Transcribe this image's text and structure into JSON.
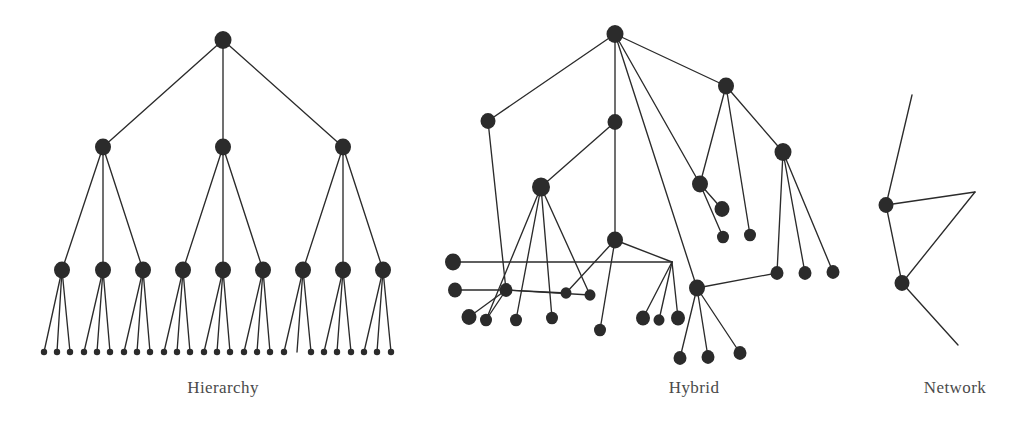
{
  "figure": {
    "width": 1031,
    "height": 423,
    "background_color": "#ffffff",
    "ink_color": "#2b2b2b",
    "caption_color": "#4a4a4a",
    "panel_count": 3
  },
  "panels": [
    {
      "id": "hierarchy",
      "caption": "Hierarchy",
      "caption_x": 223,
      "caption_y": 378,
      "description": "Strict 3-level tree: 1 root, 3 second-level nodes, 9 third-level nodes, 27 leaf nodes"
    },
    {
      "id": "hybrid",
      "caption": "Hybrid",
      "caption_x": 694,
      "caption_y": 378,
      "description": "Irregular tree-and-graph mixture with crossing edges and shared children"
    },
    {
      "id": "network",
      "caption": "Network",
      "caption_x": 955,
      "caption_y": 378,
      "description": "Two nodes with open-ended edges radiating outward"
    }
  ],
  "chart_data": {
    "type": "diagram",
    "title": "",
    "subtitle": "",
    "legend": [],
    "graphs": [
      {
        "name": "Hierarchy",
        "label": "Hierarchy",
        "node_radius_by_level": [
          8.5,
          8.0,
          8.0,
          3.2
        ],
        "nodes": [
          {
            "id": "h-root",
            "x": 223,
            "y": 40,
            "r": 8.5,
            "level": 0
          },
          {
            "id": "h-a",
            "x": 103,
            "y": 147,
            "r": 8.0,
            "level": 1
          },
          {
            "id": "h-b",
            "x": 223,
            "y": 147,
            "r": 8.0,
            "level": 1
          },
          {
            "id": "h-c",
            "x": 343,
            "y": 147,
            "r": 8.0,
            "level": 1
          },
          {
            "id": "h-a1",
            "x": 62,
            "y": 270,
            "r": 8.0,
            "level": 2
          },
          {
            "id": "h-a2",
            "x": 103,
            "y": 270,
            "r": 8.0,
            "level": 2
          },
          {
            "id": "h-a3",
            "x": 143,
            "y": 270,
            "r": 8.0,
            "level": 2
          },
          {
            "id": "h-b1",
            "x": 183,
            "y": 270,
            "r": 8.0,
            "level": 2
          },
          {
            "id": "h-b2",
            "x": 223,
            "y": 270,
            "r": 8.0,
            "level": 2
          },
          {
            "id": "h-b3",
            "x": 263,
            "y": 270,
            "r": 8.0,
            "level": 2
          },
          {
            "id": "h-c1",
            "x": 303,
            "y": 270,
            "r": 8.0,
            "level": 2
          },
          {
            "id": "h-c2",
            "x": 343,
            "y": 270,
            "r": 8.0,
            "level": 2
          },
          {
            "id": "h-c3",
            "x": 383,
            "y": 270,
            "r": 8.0,
            "level": 2
          },
          {
            "id": "h-l1",
            "x": 44,
            "y": 352,
            "r": 3.2,
            "level": 3
          },
          {
            "id": "h-l2",
            "x": 57,
            "y": 352,
            "r": 3.2,
            "level": 3
          },
          {
            "id": "h-l3",
            "x": 70,
            "y": 352,
            "r": 3.2,
            "level": 3
          },
          {
            "id": "h-l4",
            "x": 84,
            "y": 352,
            "r": 3.2,
            "level": 3
          },
          {
            "id": "h-l5",
            "x": 97,
            "y": 352,
            "r": 3.2,
            "level": 3
          },
          {
            "id": "h-l6",
            "x": 110,
            "y": 352,
            "r": 3.2,
            "level": 3
          },
          {
            "id": "h-l7",
            "x": 124,
            "y": 352,
            "r": 3.2,
            "level": 3
          },
          {
            "id": "h-l8",
            "x": 137,
            "y": 352,
            "r": 3.2,
            "level": 3
          },
          {
            "id": "h-l9",
            "x": 150,
            "y": 352,
            "r": 3.2,
            "level": 3
          },
          {
            "id": "h-l10",
            "x": 164,
            "y": 352,
            "r": 3.2,
            "level": 3
          },
          {
            "id": "h-l11",
            "x": 177,
            "y": 352,
            "r": 3.2,
            "level": 3
          },
          {
            "id": "h-l12",
            "x": 190,
            "y": 352,
            "r": 3.2,
            "level": 3
          },
          {
            "id": "h-l13",
            "x": 204,
            "y": 352,
            "r": 3.2,
            "level": 3
          },
          {
            "id": "h-l14",
            "x": 217,
            "y": 352,
            "r": 3.2,
            "level": 3
          },
          {
            "id": "h-l15",
            "x": 230,
            "y": 352,
            "r": 3.2,
            "level": 3
          },
          {
            "id": "h-l16",
            "x": 244,
            "y": 352,
            "r": 3.2,
            "level": 3
          },
          {
            "id": "h-l17",
            "x": 257,
            "y": 352,
            "r": 3.2,
            "level": 3
          },
          {
            "id": "h-l18",
            "x": 270,
            "y": 352,
            "r": 3.2,
            "level": 3
          },
          {
            "id": "h-l19",
            "x": 284,
            "y": 352,
            "r": 3.2,
            "level": 3
          },
          {
            "id": "h-l20",
            "x": 297,
            "y": 352,
            "r": 0.0,
            "level": 3
          },
          {
            "id": "h-l21",
            "x": 311,
            "y": 352,
            "r": 3.2,
            "level": 3
          },
          {
            "id": "h-l22",
            "x": 324,
            "y": 352,
            "r": 3.2,
            "level": 3
          },
          {
            "id": "h-l23",
            "x": 337,
            "y": 352,
            "r": 3.2,
            "level": 3
          },
          {
            "id": "h-l24",
            "x": 351,
            "y": 352,
            "r": 3.2,
            "level": 3
          },
          {
            "id": "h-l25",
            "x": 364,
            "y": 352,
            "r": 3.2,
            "level": 3
          },
          {
            "id": "h-l26",
            "x": 377,
            "y": 352,
            "r": 3.2,
            "level": 3
          },
          {
            "id": "h-l27",
            "x": 391,
            "y": 352,
            "r": 3.2,
            "level": 3
          }
        ],
        "edges": [
          [
            "h-root",
            "h-a"
          ],
          [
            "h-root",
            "h-b"
          ],
          [
            "h-root",
            "h-c"
          ],
          [
            "h-a",
            "h-a1"
          ],
          [
            "h-a",
            "h-a2"
          ],
          [
            "h-a",
            "h-a3"
          ],
          [
            "h-b",
            "h-b1"
          ],
          [
            "h-b",
            "h-b2"
          ],
          [
            "h-b",
            "h-b3"
          ],
          [
            "h-c",
            "h-c1"
          ],
          [
            "h-c",
            "h-c2"
          ],
          [
            "h-c",
            "h-c3"
          ],
          [
            "h-a1",
            "h-l1"
          ],
          [
            "h-a1",
            "h-l2"
          ],
          [
            "h-a1",
            "h-l3"
          ],
          [
            "h-a2",
            "h-l4"
          ],
          [
            "h-a2",
            "h-l5"
          ],
          [
            "h-a2",
            "h-l6"
          ],
          [
            "h-a3",
            "h-l7"
          ],
          [
            "h-a3",
            "h-l8"
          ],
          [
            "h-a3",
            "h-l9"
          ],
          [
            "h-b1",
            "h-l10"
          ],
          [
            "h-b1",
            "h-l11"
          ],
          [
            "h-b1",
            "h-l12"
          ],
          [
            "h-b2",
            "h-l13"
          ],
          [
            "h-b2",
            "h-l14"
          ],
          [
            "h-b2",
            "h-l15"
          ],
          [
            "h-b3",
            "h-l16"
          ],
          [
            "h-b3",
            "h-l17"
          ],
          [
            "h-b3",
            "h-l18"
          ],
          [
            "h-c1",
            "h-l19"
          ],
          [
            "h-c1",
            "h-l20"
          ],
          [
            "h-c1",
            "h-l21"
          ],
          [
            "h-c2",
            "h-l22"
          ],
          [
            "h-c2",
            "h-l23"
          ],
          [
            "h-c2",
            "h-l24"
          ],
          [
            "h-c3",
            "h-l25"
          ],
          [
            "h-c3",
            "h-l26"
          ],
          [
            "h-c3",
            "h-l27"
          ]
        ]
      },
      {
        "name": "Hybrid",
        "label": "Hybrid",
        "nodes": [
          {
            "id": "y-root",
            "x": 615,
            "y": 34,
            "r": 8.5
          },
          {
            "id": "y-l1",
            "x": 488,
            "y": 121,
            "r": 7.5
          },
          {
            "id": "y-m1",
            "x": 615,
            "y": 122,
            "r": 7.5
          },
          {
            "id": "y-r1",
            "x": 726,
            "y": 86,
            "r": 8.0
          },
          {
            "id": "y-r2",
            "x": 783,
            "y": 152,
            "r": 8.5
          },
          {
            "id": "y-r3",
            "x": 700,
            "y": 184,
            "r": 8.0
          },
          {
            "id": "y-m2",
            "x": 541,
            "y": 187,
            "r": 9.0
          },
          {
            "id": "y-m3",
            "x": 615,
            "y": 240,
            "r": 8.0
          },
          {
            "id": "y-hub",
            "x": 697,
            "y": 288,
            "r": 8.0
          },
          {
            "id": "y-bend",
            "x": 672,
            "y": 262,
            "r": 0.0
          },
          {
            "id": "y-hl1",
            "x": 453,
            "y": 262,
            "r": 8.0
          },
          {
            "id": "y-hl2",
            "x": 455,
            "y": 290,
            "r": 7.0
          },
          {
            "id": "y-c1",
            "x": 506,
            "y": 290,
            "r": 6.5
          },
          {
            "id": "y-c2",
            "x": 566,
            "y": 293,
            "r": 5.5
          },
          {
            "id": "y-c3",
            "x": 590,
            "y": 295,
            "r": 5.5
          },
          {
            "id": "y-c4",
            "x": 469,
            "y": 317,
            "r": 7.5
          },
          {
            "id": "y-c5",
            "x": 486,
            "y": 320,
            "r": 6.0
          },
          {
            "id": "y-c6",
            "x": 516,
            "y": 320,
            "r": 6.0
          },
          {
            "id": "y-c7",
            "x": 552,
            "y": 318,
            "r": 6.0
          },
          {
            "id": "y-c8",
            "x": 600,
            "y": 330,
            "r": 6.0
          },
          {
            "id": "y-c9",
            "x": 643,
            "y": 318,
            "r": 7.0
          },
          {
            "id": "y-c10",
            "x": 659,
            "y": 320,
            "r": 5.5
          },
          {
            "id": "y-c11",
            "x": 678,
            "y": 318,
            "r": 7.0
          },
          {
            "id": "y-c12",
            "x": 680,
            "y": 358,
            "r": 6.5
          },
          {
            "id": "y-c13",
            "x": 708,
            "y": 357,
            "r": 6.5
          },
          {
            "id": "y-c14",
            "x": 740,
            "y": 353,
            "r": 6.5
          },
          {
            "id": "y-c15",
            "x": 722,
            "y": 209,
            "r": 7.5
          },
          {
            "id": "y-c16",
            "x": 723,
            "y": 237,
            "r": 6.0
          },
          {
            "id": "y-c17",
            "x": 750,
            "y": 235,
            "r": 6.0
          },
          {
            "id": "y-c18",
            "x": 777,
            "y": 273,
            "r": 6.5
          },
          {
            "id": "y-c19",
            "x": 805,
            "y": 273,
            "r": 6.5
          },
          {
            "id": "y-c20",
            "x": 833,
            "y": 272,
            "r": 6.5
          }
        ],
        "edges": [
          [
            "y-root",
            "y-l1"
          ],
          [
            "y-root",
            "y-m1"
          ],
          [
            "y-root",
            "y-r1"
          ],
          [
            "y-root",
            "y-r3"
          ],
          [
            "y-root",
            "y-hub"
          ],
          [
            "y-r1",
            "y-r2"
          ],
          [
            "y-r1",
            "y-r3"
          ],
          [
            "y-r1",
            "y-c17"
          ],
          [
            "y-r3",
            "y-c15"
          ],
          [
            "y-r3",
            "y-c16"
          ],
          [
            "y-r2",
            "y-c18"
          ],
          [
            "y-r2",
            "y-c19"
          ],
          [
            "y-r2",
            "y-c20"
          ],
          [
            "y-m1",
            "y-m2"
          ],
          [
            "y-m1",
            "y-m3"
          ],
          [
            "y-m2",
            "y-c5"
          ],
          [
            "y-m2",
            "y-c6"
          ],
          [
            "y-m2",
            "y-c7"
          ],
          [
            "y-m2",
            "y-c3"
          ],
          [
            "y-m3",
            "y-c8"
          ],
          [
            "y-m3",
            "y-c2"
          ],
          [
            "y-l1",
            "y-c1"
          ],
          [
            "y-hl1",
            "y-bend"
          ],
          [
            "y-hl2",
            "y-c1"
          ],
          [
            "y-m3",
            "y-bend"
          ],
          [
            "y-bend",
            "y-c9"
          ],
          [
            "y-bend",
            "y-c10"
          ],
          [
            "y-bend",
            "y-c11"
          ],
          [
            "y-hub",
            "y-c12"
          ],
          [
            "y-hub",
            "y-c13"
          ],
          [
            "y-hub",
            "y-c14"
          ],
          [
            "y-hub",
            "y-c18"
          ],
          [
            "y-c1",
            "y-c4"
          ],
          [
            "y-c1",
            "y-c5"
          ],
          [
            "y-c1",
            "y-c2"
          ],
          [
            "y-c1",
            "y-c3"
          ]
        ]
      },
      {
        "name": "Network",
        "label": "Network",
        "nodes": [
          {
            "id": "n-a",
            "x": 886,
            "y": 205,
            "r": 7.5
          },
          {
            "id": "n-b",
            "x": 902,
            "y": 283,
            "r": 7.5
          }
        ],
        "edges": [
          [
            "n-a",
            "n-b"
          ]
        ],
        "open_edges": [
          {
            "from": "n-a",
            "to_x": 912,
            "to_y": 95
          },
          {
            "from": "n-a",
            "to_x": 975,
            "to_y": 192
          },
          {
            "from": "n-b",
            "to_x": 975,
            "to_y": 192
          },
          {
            "from": "n-b",
            "to_x": 958,
            "to_y": 345
          }
        ]
      }
    ]
  }
}
